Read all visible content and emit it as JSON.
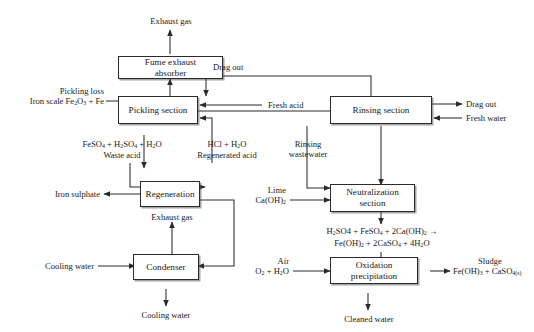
{
  "diagram": {
    "type": "process-flow-diagram",
    "nodes": [
      {
        "id": "fume_exhaust_absorber",
        "label_line1": "Fume exhaust",
        "label_line2": "absorber"
      },
      {
        "id": "pickling_section",
        "label_line1": "Pickling section",
        "label_line2": ""
      },
      {
        "id": "rinsing_section",
        "label_line1": "Rinsing section",
        "label_line2": ""
      },
      {
        "id": "regeneration",
        "label_line1": "Regeneration",
        "label_line2": ""
      },
      {
        "id": "condenser",
        "label_line1": "Condenser",
        "label_line2": ""
      },
      {
        "id": "neutralization_section",
        "label_line1": "Neutralization",
        "label_line2": "section"
      },
      {
        "id": "oxidation_precipitation",
        "label_line1": "Oxidation",
        "label_line2": "precipitation"
      }
    ],
    "stream_labels": {
      "exhaust_gas_top": "Exhaust gas",
      "drag_out_top": "Drag out",
      "pickling_loss_l1": "Pickling loss",
      "pickling_loss_l2_pre": "Iron scale Fe",
      "pickling_loss_l2_sub1": "2",
      "pickling_loss_l2_mid": "O",
      "pickling_loss_l2_sub2": "3",
      "pickling_loss_l2_post": " + Fe",
      "fresh_acid": "Fresh acid",
      "drag_out_right": "Drag out",
      "fresh_water": "Fresh water",
      "waste_acid_l1_pre": "FeSO",
      "waste_acid_l1_s1": "4",
      "waste_acid_l1_mid": " + H",
      "waste_acid_l1_s2": "2",
      "waste_acid_l1_mid2": "SO",
      "waste_acid_l1_s3": "4",
      "waste_acid_l1_mid3": " + H",
      "waste_acid_l1_s4": "2",
      "waste_acid_l1_end": "O",
      "waste_acid_l2": "Waste acid",
      "regenerated_acid_l1_pre": "HCl + H",
      "regenerated_acid_l1_sub": "2",
      "regenerated_acid_l1_post": "O",
      "regenerated_acid_l2": "Regenerated acid",
      "rinsing_wastewater_l1": "Rinsing",
      "rinsing_wastewater_l2": "wastewater",
      "iron_sulphate": "Iron sulphate",
      "exhaust_gas_regen": "Exhaust gas",
      "lime_l1": "Lime",
      "lime_l2_pre": "Ca(OH)",
      "lime_l2_sub": "2",
      "cooling_water_in": "Cooling water",
      "cooling_water_out": "Cooling water",
      "air_l1": "Air",
      "air_l2_pre": "O",
      "air_l2_s1": "2",
      "air_l2_mid": " + H",
      "air_l2_s2": "2",
      "air_l2_end": "O",
      "cleaned_water": "Cleaned water",
      "sludge_l1": "Sludge",
      "sludge_l2_pre": "Fe(OH)",
      "sludge_l2_s1": "3",
      "sludge_l2_mid": " + CaSO",
      "sludge_l2_s2": "4(s)"
    },
    "reaction": {
      "line1_a": "H",
      "line1_s1": "2",
      "line1_b": "SO4 + FeSO",
      "line1_s2": "4",
      "line1_c": " + 2Ca(OH)",
      "line1_s3": "2",
      "line1_d": " →",
      "line2_a": "Fe(OH)",
      "line2_s1": "2",
      "line2_b": " + 2CaSO",
      "line2_s2": "4",
      "line2_c": " + 4H",
      "line2_s3": "2",
      "line2_d": "O"
    },
    "colors": {
      "line": "#2b2b2b",
      "box_fill": "#ffffff",
      "text": "#1a1a1a",
      "shadow": "#5a5a5a",
      "background": "#ffffff"
    }
  }
}
